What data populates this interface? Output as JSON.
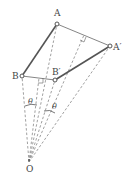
{
  "diagram": {
    "type": "geometry-rotation",
    "points": {
      "A": {
        "label": "A",
        "x": 57,
        "y": 24
      },
      "A_prime": {
        "label": "A′",
        "x": 110,
        "y": 46
      },
      "B": {
        "label": "B",
        "x": 22,
        "y": 76
      },
      "B_prime": {
        "label": "B′",
        "x": 55,
        "y": 80
      },
      "O": {
        "label": "O",
        "x": 29,
        "y": 162
      }
    },
    "segments": [
      {
        "from": "A",
        "to": "B",
        "style": "solid-bold"
      },
      {
        "from": "A_prime",
        "to": "B_prime",
        "style": "solid-bold"
      },
      {
        "from": "A",
        "to": "A_prime",
        "style": "solid-thin"
      },
      {
        "from": "B",
        "to": "B_prime",
        "style": "solid-thin"
      }
    ],
    "angle_labels": [
      {
        "text": "θ",
        "x": 31,
        "y": 110
      },
      {
        "text": "θ",
        "x": 52,
        "y": 111
      }
    ],
    "colors": {
      "line": "#555555",
      "dash": "#777777",
      "text": "#444444"
    }
  }
}
